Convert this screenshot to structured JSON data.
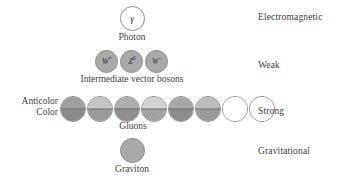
{
  "figure": {
    "background_color": "#ffffff",
    "text_color": "#3d3d3d",
    "outline_color": "#8a8a8a",
    "fill_gray": "#a9a9a9"
  },
  "rows": [
    {
      "id": "electromagnetic",
      "force_label": "Electromagnetic",
      "caption": "Photon",
      "particles": [
        {
          "symbol": "γ",
          "superscript": "",
          "fill": "hollow"
        }
      ]
    },
    {
      "id": "weak",
      "force_label": "Weak",
      "caption": "Intermediate vector bosons",
      "particles": [
        {
          "symbol": "W",
          "superscript": "+",
          "fill": "filled"
        },
        {
          "symbol": "Z",
          "superscript": "0",
          "fill": "filled"
        },
        {
          "symbol": "W",
          "superscript": "−",
          "fill": "filled"
        }
      ]
    },
    {
      "id": "strong",
      "force_label": "Strong",
      "caption": "Gluons",
      "side_labels": {
        "anticolor": "Anticolor",
        "color": "Color"
      },
      "gluons": [
        {
          "top": "#9f9f9f",
          "bottom": "#8a8a8a",
          "split": true
        },
        {
          "top": "#c5c5c5",
          "bottom": "#999999",
          "split": true
        },
        {
          "top": "#adadad",
          "bottom": "#8e8e8e",
          "split": true
        },
        {
          "top": "#d2d2d2",
          "bottom": "#a3a3a3",
          "split": true
        },
        {
          "top": "#a8a8a8",
          "bottom": "#8c8c8c",
          "split": true
        },
        {
          "top": "#bdbdbd",
          "bottom": "#9a9a9a",
          "split": true
        },
        {
          "top": "#ffffff",
          "bottom": "#ffffff",
          "split": false
        },
        {
          "top": "#ffffff",
          "bottom": "#ffffff",
          "split": false
        }
      ]
    },
    {
      "id": "gravitational",
      "force_label": "Gravitational",
      "caption": "Graviton",
      "particles": [
        {
          "symbol": "",
          "superscript": "",
          "fill": "filled"
        }
      ]
    }
  ]
}
